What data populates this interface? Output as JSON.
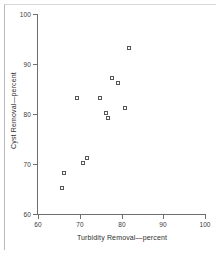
{
  "chart_data": {
    "type": "scatter",
    "title": "",
    "xlabel": "Turbidity Removal—percent",
    "ylabel": "Cyst Removal—percent",
    "xlim": [
      60,
      100
    ],
    "ylim": [
      60,
      100
    ],
    "xticks": [
      60,
      70,
      80,
      90,
      100
    ],
    "yticks": [
      60,
      70,
      80,
      90,
      100
    ],
    "xticklabels": [
      "60",
      "70",
      "80",
      "90",
      "100"
    ],
    "yticklabels": [
      "60",
      "70",
      "80",
      "90",
      "100"
    ],
    "grid": false,
    "legend": null,
    "marker": "open-square",
    "marker_color": "#555555",
    "points": [
      {
        "x": 66.0,
        "y": 65.0
      },
      {
        "x": 66.5,
        "y": 68.0
      },
      {
        "x": 69.5,
        "y": 83.0
      },
      {
        "x": 71.0,
        "y": 70.0
      },
      {
        "x": 72.0,
        "y": 71.0
      },
      {
        "x": 75.0,
        "y": 83.0
      },
      {
        "x": 76.5,
        "y": 80.0
      },
      {
        "x": 77.0,
        "y": 79.0
      },
      {
        "x": 78.0,
        "y": 87.0
      },
      {
        "x": 79.5,
        "y": 86.0
      },
      {
        "x": 81.0,
        "y": 81.0
      },
      {
        "x": 82.0,
        "y": 93.0
      }
    ]
  },
  "figure": {
    "background_color": "#ffffff",
    "axis_color": "#6e6e6e",
    "text_color": "#2e2e2e"
  }
}
